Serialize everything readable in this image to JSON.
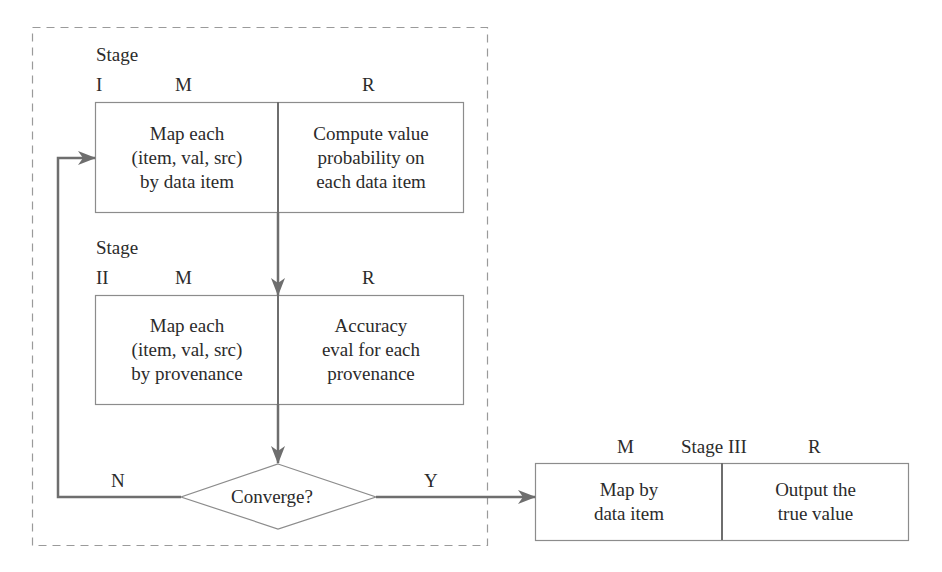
{
  "diagram": {
    "colors": {
      "arrow": "#6e6e6e",
      "box_border": "#8c8c8c",
      "dashed_border": "#9a9a9a",
      "text": "#2b2b2b"
    },
    "stage1": {
      "stage_label": "Stage",
      "numeral": "I",
      "m_label": "M",
      "r_label": "R",
      "map_text": [
        "Map each",
        "(item, val, src)",
        "by data item"
      ],
      "reduce_text": [
        "Compute value",
        "probability on",
        "each data item"
      ]
    },
    "stage2": {
      "stage_label": "Stage",
      "numeral": "II",
      "m_label": "M",
      "r_label": "R",
      "map_text": [
        "Map each",
        "(item, val, src)",
        "by provenance"
      ],
      "reduce_text": [
        "Accuracy",
        "eval for each",
        "provenance"
      ]
    },
    "decision": {
      "text": "Converge?",
      "no_label": "N",
      "yes_label": "Y"
    },
    "stage3": {
      "m_label": "M",
      "stage_label": "Stage III",
      "r_label": "R",
      "map_text": [
        "Map by",
        "data item"
      ],
      "reduce_text": [
        "Output the",
        "true value"
      ]
    }
  }
}
